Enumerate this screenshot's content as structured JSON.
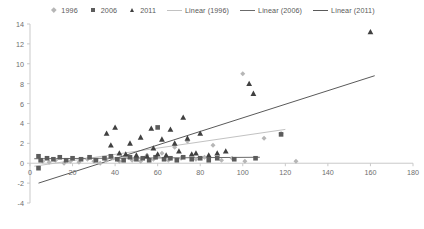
{
  "legend": {
    "position": "top-center",
    "entries": [
      {
        "label": "1996",
        "marker": "diamond-icon",
        "color": "#b6b6b6"
      },
      {
        "label": "2006",
        "marker": "square-icon",
        "color": "#5c5c5c"
      },
      {
        "label": "2011",
        "marker": "triangle-icon",
        "color": "#404040"
      },
      {
        "label": "Linear (1996)",
        "marker": "line-icon",
        "color": "#c2c2c2"
      },
      {
        "label": "Linear (2006)",
        "marker": "line-icon",
        "color": "#6b6b6b"
      },
      {
        "label": "Linear (2011)",
        "marker": "line-icon",
        "color": "#5a5a5a"
      }
    ]
  },
  "axes": {
    "y_ticks": [
      "14",
      "12",
      "10",
      "8",
      "6",
      "4",
      "2",
      "0",
      "-2",
      "-4"
    ],
    "x_ticks": [
      "0",
      "20",
      "40",
      "60",
      "80",
      "100",
      "120",
      "140",
      "160",
      "180"
    ]
  },
  "chart_data": {
    "type": "scatter",
    "title": "",
    "xlabel": "",
    "ylabel": "",
    "xlim": [
      0,
      180
    ],
    "ylim": [
      -4,
      14
    ],
    "xtick_step": 20,
    "ytick_step": 2,
    "grid": false,
    "legend_position": "top-center",
    "series": [
      {
        "name": "1996",
        "marker": "diamond",
        "color": "#b6b6b6",
        "points": [
          [
            6,
            0.2
          ],
          [
            9,
            0.1
          ],
          [
            12,
            0.3
          ],
          [
            16,
            0.0
          ],
          [
            19,
            0.2
          ],
          [
            23,
            0.1
          ],
          [
            27,
            0.4
          ],
          [
            30,
            0.2
          ],
          [
            33,
            0.0
          ],
          [
            36,
            0.3
          ],
          [
            39,
            0.5
          ],
          [
            42,
            0.2
          ],
          [
            45,
            0.6
          ],
          [
            48,
            0.3
          ],
          [
            52,
            0.2
          ],
          [
            55,
            0.8
          ],
          [
            58,
            0.4
          ],
          [
            62,
            1.0
          ],
          [
            65,
            0.3
          ],
          [
            68,
            1.6
          ],
          [
            71,
            0.5
          ],
          [
            74,
            2.2
          ],
          [
            78,
            0.4
          ],
          [
            82,
            0.6
          ],
          [
            86,
            1.8
          ],
          [
            90,
            0.3
          ],
          [
            95,
            0.5
          ],
          [
            100,
            9.0
          ],
          [
            101,
            0.2
          ],
          [
            110,
            2.5
          ],
          [
            118,
            3.0
          ],
          [
            125,
            0.2
          ]
        ]
      },
      {
        "name": "2006",
        "marker": "square",
        "color": "#5c5c5c",
        "points": [
          [
            4,
            0.7
          ],
          [
            4,
            -0.5
          ],
          [
            5,
            0.3
          ],
          [
            8,
            0.5
          ],
          [
            11,
            0.4
          ],
          [
            14,
            0.6
          ],
          [
            17,
            0.3
          ],
          [
            20,
            0.5
          ],
          [
            24,
            0.4
          ],
          [
            28,
            0.6
          ],
          [
            31,
            0.3
          ],
          [
            35,
            0.5
          ],
          [
            38,
            0.7
          ],
          [
            41,
            0.4
          ],
          [
            44,
            0.3
          ],
          [
            47,
            0.6
          ],
          [
            50,
            0.4
          ],
          [
            53,
            0.5
          ],
          [
            56,
            0.3
          ],
          [
            59,
            0.6
          ],
          [
            60,
            3.6
          ],
          [
            63,
            0.4
          ],
          [
            66,
            0.5
          ],
          [
            69,
            0.3
          ],
          [
            72,
            0.6
          ],
          [
            76,
            0.4
          ],
          [
            80,
            0.5
          ],
          [
            84,
            0.3
          ],
          [
            88,
            0.5
          ],
          [
            96,
            0.4
          ],
          [
            106,
            0.5
          ],
          [
            118,
            2.9
          ]
        ]
      },
      {
        "name": "2011",
        "marker": "triangle",
        "color": "#404040",
        "points": [
          [
            36,
            3.0
          ],
          [
            38,
            1.8
          ],
          [
            40,
            3.6
          ],
          [
            42,
            1.0
          ],
          [
            45,
            0.9
          ],
          [
            47,
            2.0
          ],
          [
            50,
            0.8
          ],
          [
            52,
            2.6
          ],
          [
            55,
            0.7
          ],
          [
            57,
            3.5
          ],
          [
            58,
            1.5
          ],
          [
            60,
            0.9
          ],
          [
            62,
            2.4
          ],
          [
            64,
            0.8
          ],
          [
            66,
            3.4
          ],
          [
            68,
            2.0
          ],
          [
            70,
            1.2
          ],
          [
            72,
            4.6
          ],
          [
            74,
            2.5
          ],
          [
            76,
            0.9
          ],
          [
            78,
            1.0
          ],
          [
            80,
            3.0
          ],
          [
            84,
            0.8
          ],
          [
            88,
            1.0
          ],
          [
            92,
            1.2
          ],
          [
            103,
            8.0
          ],
          [
            105,
            7.0
          ],
          [
            160,
            13.2
          ]
        ]
      }
    ],
    "trend_lines": [
      {
        "name": "Linear (1996)",
        "color": "#c2c2c2",
        "x0": 2,
        "y0": -0.3,
        "x1": 120,
        "y1": 3.4,
        "slope": 0.031,
        "intercept": -0.36
      },
      {
        "name": "Linear (2006)",
        "color": "#6b6b6b",
        "x0": 2,
        "y0": 0.45,
        "x1": 108,
        "y1": 0.6,
        "slope": 0.0014,
        "intercept": 0.45
      },
      {
        "name": "Linear (2011)",
        "color": "#5a5a5a",
        "x0": 4,
        "y0": -2.0,
        "x1": 162,
        "y1": 8.8,
        "slope": 0.0684,
        "intercept": -2.27
      }
    ],
    "baseline_y": 0
  }
}
